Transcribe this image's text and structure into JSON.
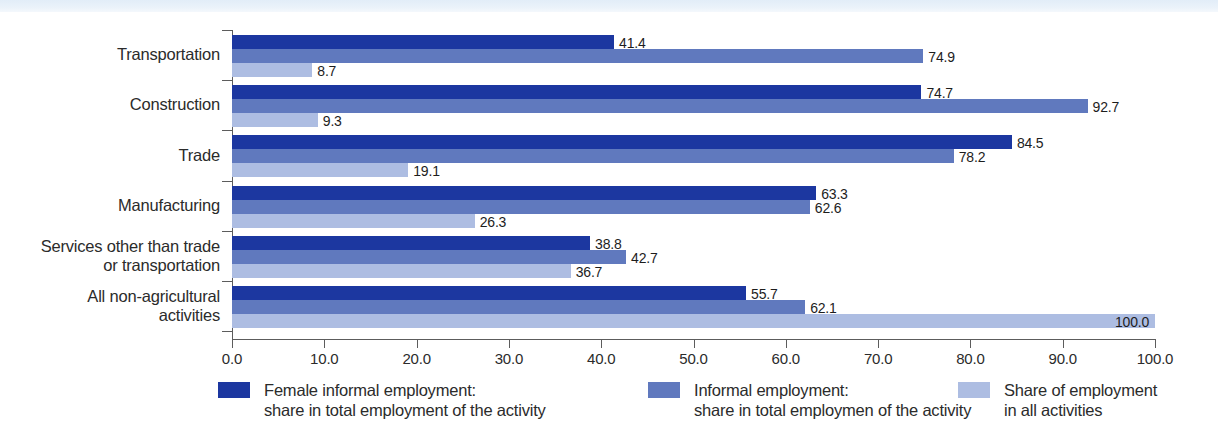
{
  "chart_data": {
    "type": "bar",
    "orientation": "horizontal",
    "title": "",
    "xlabel": "",
    "ylabel": "",
    "xlim": [
      0,
      100
    ],
    "grid": false,
    "legend_position": "bottom",
    "categories": [
      "Transportation",
      "Construction",
      "Trade",
      "Manufacturing",
      "Services other than trade\nor transportation",
      "All non-agricultural\nactivities"
    ],
    "x_ticks": [
      "0.0",
      "10.0",
      "20.0",
      "30.0",
      "40.0",
      "50.0",
      "60.0",
      "70.0",
      "80.0",
      "90.0",
      "100.0"
    ],
    "x_tick_values": [
      0,
      10,
      20,
      30,
      40,
      50,
      60,
      70,
      80,
      90,
      100
    ],
    "series": [
      {
        "name": "Female informal employment:\nshare in total employment of the activity",
        "color": "#1c37a0",
        "values": [
          41.4,
          74.7,
          84.5,
          63.3,
          38.8,
          55.7
        ],
        "labels": [
          "41.4",
          "74.7",
          "84.5",
          "63.3",
          "38.8",
          "55.7"
        ]
      },
      {
        "name": "Informal employment:\nshare in total employmen of the activity",
        "color": "#6079be",
        "values": [
          74.9,
          92.7,
          78.2,
          62.6,
          42.7,
          62.1
        ],
        "labels": [
          "74.9",
          "92.7",
          "78.2",
          "62.6",
          "42.7",
          "62.1"
        ]
      },
      {
        "name": "Share of employment\nin all activities",
        "color": "#adbde2",
        "values": [
          8.7,
          9.3,
          19.1,
          26.3,
          36.7,
          100.0
        ],
        "labels": [
          "8.7",
          "9.3",
          "19.1",
          "26.3",
          "36.7",
          "100.0"
        ]
      }
    ]
  },
  "legend": {
    "items": [
      {
        "swatch": "#1c37a0",
        "label": "Female informal employment:\nshare in total employment of the activity"
      },
      {
        "swatch": "#6079be",
        "label": "Informal employment:\nshare in total employmen of the activity"
      },
      {
        "swatch": "#adbde2",
        "label": "Share of employment\nin all activities"
      }
    ]
  },
  "colors": {
    "series_1": "#1c37a0",
    "series_2": "#6079be",
    "series_3": "#adbde2",
    "axis": "#5c5c5c",
    "text": "#2b2b2b",
    "top_band": "#e2edf8",
    "background": "#ffffff"
  }
}
